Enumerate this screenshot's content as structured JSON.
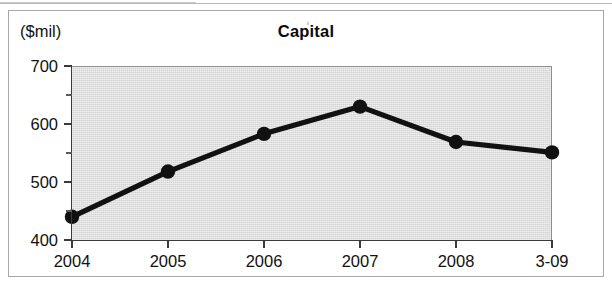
{
  "figure": {
    "unit_label": "($mil)",
    "title": "Capital"
  },
  "chart_data": {
    "type": "line",
    "title": "Capital",
    "subtitle": "",
    "xlabel": "",
    "ylabel": "($mil)",
    "unit": "$mil",
    "categories": [
      "2004",
      "2005",
      "2006",
      "2007",
      "2008",
      "3-09"
    ],
    "values": [
      440,
      518,
      583,
      630,
      569,
      551
    ],
    "series": [
      {
        "name": "Capital",
        "values": [
          440,
          518,
          583,
          630,
          569,
          551
        ]
      }
    ],
    "ylim": [
      400,
      700
    ],
    "yticks": [
      400,
      500,
      600,
      700
    ],
    "ytick_labels": [
      "400",
      "500",
      "600",
      "700"
    ],
    "yminor_ticks": [
      450,
      550,
      650
    ],
    "grid": false,
    "legend": false,
    "legend_position": "none",
    "marker": "circle",
    "line_color": "#111111",
    "marker_color": "#111111",
    "plot_background": "#d3d3d3"
  }
}
